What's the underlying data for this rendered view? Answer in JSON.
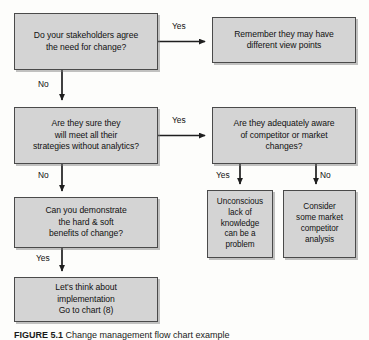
{
  "figure": {
    "caption_number": "FIGURE 5.1",
    "caption_text": "Change management flow chart example",
    "background_color": "#fdfdfb",
    "node_fill_color": "#d4d4d4",
    "node_border_color": "#4a4a4a",
    "text_color": "#111111"
  },
  "nodes": {
    "stakeholders": {
      "id": "stakeholders",
      "text": "Do your stakeholders agree\nthe need for change?",
      "type": "decision"
    },
    "viewpoints": {
      "id": "viewpoints",
      "text": "Remember they may have\ndifferent view points",
      "type": "outcome"
    },
    "strategies": {
      "id": "strategies",
      "text": "Are they sure they\nwill meet all their\nstrategies without analytics?",
      "type": "decision"
    },
    "aware": {
      "id": "aware",
      "text": "Are they adequately aware\nof competitor or market\nchanges?",
      "type": "decision"
    },
    "benefits": {
      "id": "benefits",
      "text": "Can you demonstrate\nthe hard & soft\nbenefits of change?",
      "type": "decision"
    },
    "unconscious": {
      "id": "unconscious",
      "text": "Unconscious\nlack of\nknowledge\ncan be a\nproblem",
      "type": "outcome"
    },
    "consider": {
      "id": "consider",
      "text": "Consider\nsome market\ncompetitor\nanalysis",
      "type": "outcome"
    },
    "implement": {
      "id": "implement",
      "text": "Let's think about\nimplementation\nGo to chart (8)",
      "type": "terminal"
    }
  },
  "edges": {
    "yes_top": {
      "label": "Yes",
      "from": "stakeholders",
      "to": "viewpoints",
      "direction": "right"
    },
    "no_first": {
      "label": "No",
      "from": "stakeholders",
      "to": "strategies",
      "direction": "down"
    },
    "yes_middle": {
      "label": "Yes",
      "from": "strategies",
      "to": "aware",
      "direction": "right"
    },
    "no_second": {
      "label": "No",
      "from": "strategies",
      "to": "benefits",
      "direction": "down"
    },
    "yes_bottom": {
      "label": "Yes",
      "from": "benefits",
      "to": "implement",
      "direction": "down"
    },
    "yes_aware": {
      "label": "Yes",
      "from": "aware",
      "to": "unconscious",
      "direction": "down"
    },
    "no_aware": {
      "label": "No",
      "from": "aware",
      "to": "consider",
      "direction": "down"
    }
  }
}
